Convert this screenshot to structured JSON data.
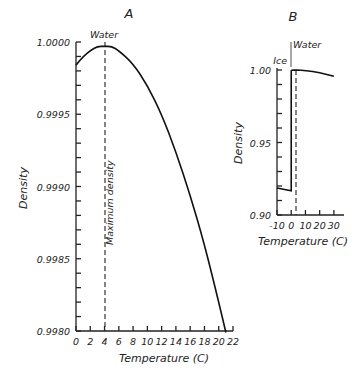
{
  "chart_data": [
    {
      "panel": "A",
      "type": "line",
      "title": "A",
      "xlabel": "Temperature (C)",
      "ylabel": "Density",
      "xlim": [
        0,
        22
      ],
      "ylim": [
        0.998,
        1.0
      ],
      "xticks": [
        "0",
        "2",
        "4",
        "6",
        "8",
        "10",
        "12",
        "14",
        "16",
        "18",
        "20",
        "22"
      ],
      "yticks": [
        "1.0000",
        "0.9995",
        "0.9990",
        "0.9985",
        "0.9980"
      ],
      "grid": false,
      "series": [
        {
          "name": "Water",
          "x": [
            0,
            1,
            2,
            3,
            4,
            5,
            6,
            8,
            10,
            12,
            14,
            16,
            18,
            20,
            21
          ],
          "y": [
            0.99984,
            0.9999,
            0.99994,
            0.99997,
            0.99997,
            0.99997,
            0.99994,
            0.99985,
            0.9997,
            0.9995,
            0.99924,
            0.99894,
            0.9986,
            0.9982,
            0.99799
          ]
        }
      ],
      "annotations": [
        {
          "text": "Water",
          "x": 4,
          "y": 1.0
        },
        {
          "text": "Maximum density",
          "x": 4,
          "orientation": "vertical",
          "style": "dashed line"
        }
      ]
    },
    {
      "panel": "B",
      "type": "line",
      "title": "B",
      "xlabel": "Temperature (C)",
      "ylabel": "Density",
      "xlim": [
        -10,
        35
      ],
      "ylim": [
        0.9,
        1.0
      ],
      "xticks": [
        "-10",
        "0",
        "10",
        "20",
        "30"
      ],
      "yticks": [
        "1.00",
        "0.95",
        "0.90"
      ],
      "grid": false,
      "series": [
        {
          "name": "Ice",
          "x": [
            -10,
            0
          ],
          "y": [
            0.9186,
            0.9167
          ]
        },
        {
          "name": "Water",
          "x": [
            0,
            4,
            10,
            20,
            30
          ],
          "y": [
            0.9998,
            1.0,
            0.9997,
            0.9982,
            0.9957
          ]
        }
      ],
      "annotations": [
        {
          "text": "Ice",
          "x": 0,
          "y": 1.0
        },
        {
          "text": "Water",
          "x": 4,
          "y": 1.0
        },
        {
          "text": "dashed line at 4 C",
          "x": 4
        }
      ]
    }
  ]
}
